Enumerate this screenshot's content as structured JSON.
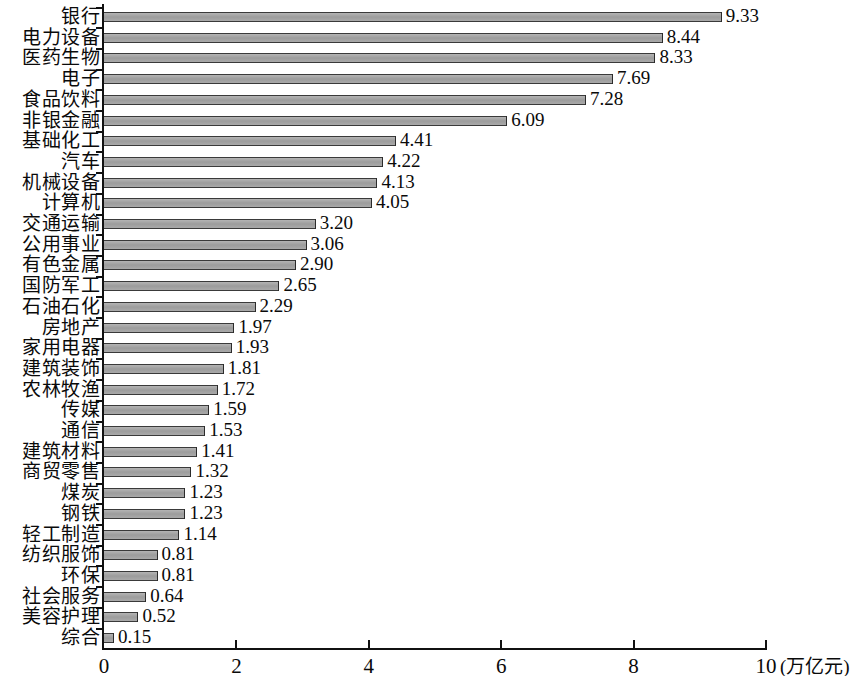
{
  "chart_data": {
    "type": "bar",
    "orientation": "horizontal",
    "title": "",
    "xlabel": "",
    "ylabel": "",
    "unit_label": "(万亿元)",
    "xlim": [
      0,
      10
    ],
    "xticks": [
      "0",
      "2",
      "4",
      "6",
      "8",
      "10"
    ],
    "xtick_values": [
      0,
      2,
      4,
      6,
      8,
      10
    ],
    "grid": false,
    "legend": false,
    "bar_color": "#a8a8a8",
    "bar_edge_color": "#2b2b2b",
    "axis_color": "#111111",
    "categories": [
      "银行",
      "电力设备",
      "医药生物",
      "电子",
      "食品饮料",
      "非银金融",
      "基础化工",
      "汽车",
      "机械设备",
      "计算机",
      "交通运输",
      "公用事业",
      "有色金属",
      "国防军工",
      "石油石化",
      "房地产",
      "家用电器",
      "建筑装饰",
      "农林牧渔",
      "传媒",
      "通信",
      "建筑材料",
      "商贸零售",
      "煤炭",
      "钢铁",
      "轻工制造",
      "纺织服饰",
      "环保",
      "社会服务",
      "美容护理",
      "综合"
    ],
    "values": [
      9.33,
      8.44,
      8.33,
      7.69,
      7.28,
      6.09,
      4.41,
      4.22,
      4.13,
      4.05,
      3.2,
      3.06,
      2.9,
      2.65,
      2.29,
      1.97,
      1.93,
      1.81,
      1.72,
      1.59,
      1.53,
      1.41,
      1.32,
      1.23,
      1.23,
      1.14,
      0.81,
      0.81,
      0.64,
      0.52,
      0.15
    ],
    "value_labels": [
      "9.33",
      "8.44",
      "8.33",
      "7.69",
      "7.28",
      "6.09",
      "4.41",
      "4.22",
      "4.13",
      "4.05",
      "3.20",
      "3.06",
      "2.90",
      "2.65",
      "2.29",
      "1.97",
      "1.93",
      "1.81",
      "1.72",
      "1.59",
      "1.53",
      "1.41",
      "1.32",
      "1.23",
      "1.23",
      "1.14",
      "0.81",
      "0.81",
      "0.64",
      "0.52",
      "0.15"
    ]
  }
}
